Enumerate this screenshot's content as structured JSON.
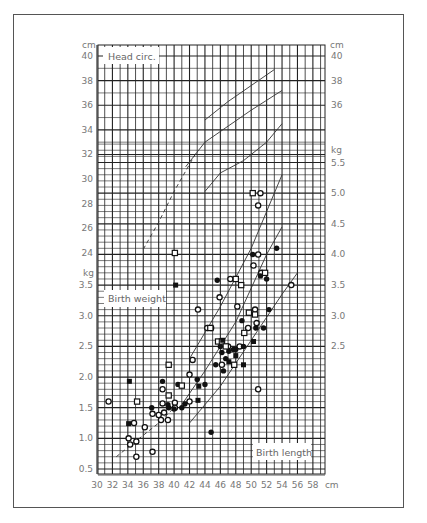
{
  "chart_data": {
    "type": "scatter",
    "title": "",
    "panels": [
      {
        "name": "head_circumference",
        "label": "Head circ.",
        "unit_label": "cm",
        "ylim": [
          23,
          40.5
        ],
        "yticks": [
          24,
          26,
          28,
          30,
          32,
          34,
          36,
          38,
          40
        ],
        "right_yticks": [
          36,
          38,
          40
        ]
      },
      {
        "name": "birth_weight",
        "label": "Birth weight",
        "unit_label": "kg",
        "ylim": [
          0.4,
          5.8
        ],
        "yticks": [
          0.5,
          1.0,
          1.5,
          2.0,
          2.5,
          3.0,
          3.5
        ],
        "right_yticks": [
          2.5,
          3.0,
          3.5,
          4.0,
          4.5,
          5.0,
          5.5
        ]
      }
    ],
    "xlabel": "Birth length",
    "x_unit": "cm",
    "xlim": [
      30,
      59.5
    ],
    "xticks": [
      30,
      32,
      34,
      36,
      38,
      40,
      42,
      44,
      46,
      48,
      50,
      52,
      54,
      56,
      58
    ],
    "grid": true,
    "reference_lines": {
      "head_circ": [
        {
          "name": "upper",
          "style": "solid",
          "points": [
            [
              44,
              34.8
            ],
            [
              47,
              36.3
            ],
            [
              50,
              37.6
            ],
            [
              53,
              38.9
            ]
          ]
        },
        {
          "name": "middle",
          "style": "solid",
          "points": [
            [
              41.5,
              31.0
            ],
            [
              44,
              33.0
            ],
            [
              47,
              34.3
            ],
            [
              50,
              35.6
            ],
            [
              54,
              37.2
            ]
          ]
        },
        {
          "name": "lower",
          "style": "solid",
          "points": [
            [
              44,
              29.0
            ],
            [
              46,
              30.5
            ],
            [
              49,
              31.5
            ],
            [
              52,
              33.0
            ],
            [
              54,
              34.5
            ]
          ]
        },
        {
          "name": "dashed",
          "style": "dashed",
          "points": [
            [
              36,
              24.3
            ],
            [
              38,
              26.5
            ],
            [
              40,
              29.0
            ],
            [
              42,
              31.2
            ],
            [
              43,
              32.3
            ]
          ]
        }
      ],
      "weight": [
        {
          "name": "upper",
          "style": "solid",
          "points": [
            [
              42,
              2.3
            ],
            [
              46,
              3.15
            ],
            [
              50,
              4.1
            ],
            [
              54,
              5.3
            ]
          ]
        },
        {
          "name": "middle",
          "style": "solid",
          "points": [
            [
              41,
              1.55
            ],
            [
              44,
              2.1
            ],
            [
              48,
              2.9
            ],
            [
              52,
              4.0
            ],
            [
              54,
              4.45
            ]
          ]
        },
        {
          "name": "lower",
          "style": "solid",
          "points": [
            [
              42,
              1.25
            ],
            [
              46,
              1.85
            ],
            [
              50,
              2.6
            ],
            [
              54,
              3.35
            ],
            [
              56,
              3.7
            ]
          ]
        },
        {
          "name": "dashed",
          "style": "dashed",
          "points": [
            [
              32.5,
              0.7
            ],
            [
              35,
              0.95
            ],
            [
              38,
              1.25
            ],
            [
              40,
              1.5
            ]
          ]
        }
      ]
    },
    "series": [
      {
        "name": "open-circle",
        "marker": "open-circle",
        "points": [
          [
            31.5,
            1.6
          ],
          [
            34.1,
            1.0
          ],
          [
            34.3,
            0.9
          ],
          [
            34.8,
            1.25
          ],
          [
            35.1,
            0.95
          ],
          [
            35.1,
            0.7
          ],
          [
            36.2,
            1.18
          ],
          [
            37.2,
            1.4
          ],
          [
            37.2,
            0.78
          ],
          [
            38.0,
            1.38
          ],
          [
            38.3,
            1.3
          ],
          [
            38.5,
            1.57
          ],
          [
            38.5,
            1.8
          ],
          [
            38.7,
            1.42
          ],
          [
            39.2,
            1.3
          ],
          [
            40.1,
            1.58
          ],
          [
            40.1,
            1.5
          ],
          [
            42.0,
            1.6
          ],
          [
            42.0,
            2.04
          ],
          [
            42.4,
            2.28
          ],
          [
            43.1,
            3.1
          ],
          [
            44.3,
            2.8
          ],
          [
            44.8,
            2.8
          ],
          [
            45.9,
            3.3
          ],
          [
            46.2,
            2.2
          ],
          [
            47.0,
            2.5
          ],
          [
            47.3,
            3.6
          ],
          [
            48.2,
            3.15
          ],
          [
            48.5,
            2.5
          ],
          [
            49.6,
            2.8
          ],
          [
            50.3,
            3.82
          ],
          [
            50.5,
            3.1
          ],
          [
            50.7,
            2.88
          ],
          [
            50.9,
            1.8
          ],
          [
            51.3,
            3.7
          ],
          [
            55.2,
            3.5
          ],
          [
            50.9,
            4.0
          ],
          [
            50.9,
            4.8
          ],
          [
            51.2,
            5.0
          ]
        ]
      },
      {
        "name": "filled-circle",
        "marker": "filled-circle",
        "points": [
          [
            37.1,
            1.5
          ],
          [
            38.5,
            1.93
          ],
          [
            39.2,
            1.55
          ],
          [
            39.3,
            1.5
          ],
          [
            40.0,
            1.48
          ],
          [
            40.5,
            1.88
          ],
          [
            41.0,
            1.5
          ],
          [
            41.4,
            1.56
          ],
          [
            43.0,
            1.96
          ],
          [
            44.0,
            1.88
          ],
          [
            44.8,
            1.1
          ],
          [
            45.4,
            2.2
          ],
          [
            45.6,
            3.58
          ],
          [
            46.0,
            2.5
          ],
          [
            46.2,
            2.4
          ],
          [
            46.4,
            2.1
          ],
          [
            46.7,
            2.3
          ],
          [
            47.1,
            2.42
          ],
          [
            47.7,
            2.45
          ],
          [
            48.0,
            2.45
          ],
          [
            48.8,
            2.92
          ],
          [
            49.0,
            2.5
          ],
          [
            50.2,
            4.0
          ],
          [
            50.6,
            2.8
          ],
          [
            51.2,
            3.65
          ],
          [
            51.6,
            2.8
          ],
          [
            52.0,
            3.6
          ],
          [
            52.3,
            3.1
          ],
          [
            53.3,
            4.1
          ]
        ]
      },
      {
        "name": "open-square",
        "marker": "open-square",
        "points": [
          [
            35.2,
            1.6
          ],
          [
            39.3,
            2.2
          ],
          [
            39.3,
            1.7
          ],
          [
            41.0,
            1.86
          ],
          [
            40.1,
            24.0
          ],
          [
            44.7,
            2.8
          ],
          [
            45.7,
            2.58
          ],
          [
            46.2,
            2.58
          ],
          [
            46.7,
            2.5
          ],
          [
            47.8,
            2.2
          ],
          [
            48.0,
            3.6
          ],
          [
            48.7,
            3.5
          ],
          [
            49.1,
            2.72
          ],
          [
            49.7,
            3.05
          ],
          [
            50.5,
            3.02
          ],
          [
            51.8,
            3.7
          ],
          [
            50.2,
            5.0
          ]
        ]
      },
      {
        "name": "filled-square",
        "marker": "filled-square",
        "points": [
          [
            34.2,
            1.93
          ],
          [
            34.1,
            1.24
          ],
          [
            40.2,
            3.5
          ],
          [
            43.1,
            1.62
          ],
          [
            43.2,
            1.85
          ],
          [
            46.3,
            2.6
          ],
          [
            47.1,
            2.25
          ],
          [
            48.0,
            2.35
          ],
          [
            49.0,
            2.2
          ],
          [
            50.3,
            2.58
          ]
        ]
      }
    ]
  },
  "labels": {
    "head_circ": "Head circ.",
    "birth_weight": "Birth weight",
    "birth_length": "Birth length",
    "cm_left": "cm",
    "cm_right": "cm",
    "kg_left": "kg",
    "kg_right": "kg",
    "x_unit": "cm"
  }
}
